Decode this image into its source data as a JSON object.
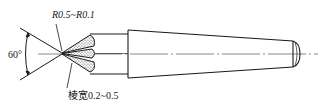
{
  "diagram": {
    "type": "engineering drawing",
    "annotations": {
      "angle_label": "60°",
      "radius_label": "R0.5~R0.1",
      "land_width_label": "棱宽0.2~0.5"
    },
    "colors": {
      "line": "#1a1a1a",
      "center_line": "#555555",
      "background": "#ffffff"
    }
  }
}
